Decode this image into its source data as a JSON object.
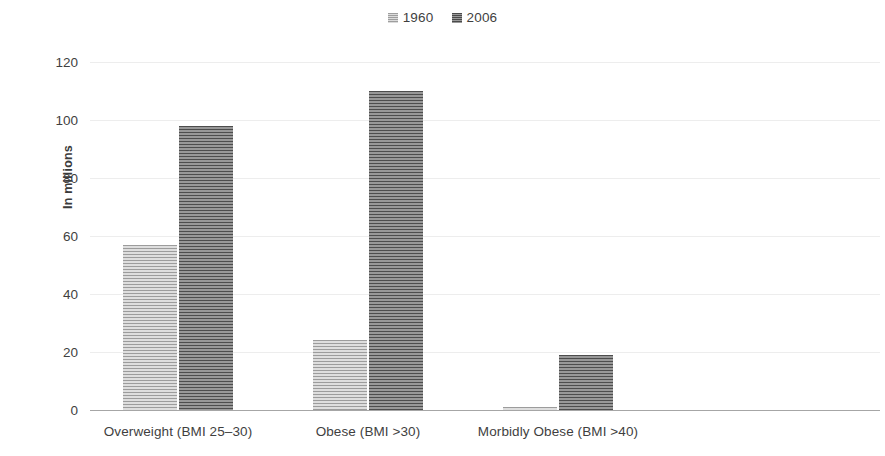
{
  "chart_data": {
    "type": "bar",
    "title": "",
    "xlabel": "",
    "ylabel": "In millions",
    "ylim": [
      0,
      120
    ],
    "yticks": [
      0,
      20,
      40,
      60,
      80,
      100,
      120
    ],
    "grid": true,
    "legend_position": "top-center",
    "categories": [
      "Overweight (BMI 25–30)",
      "Obese (BMI >30)",
      "Morbidly Obese (BMI >40)"
    ],
    "series": [
      {
        "name": "1960",
        "color": "#c4c4c4",
        "values": [
          57,
          24,
          1
        ]
      },
      {
        "name": "2006",
        "color": "#7a7a7a",
        "values": [
          98,
          110,
          19
        ]
      }
    ]
  },
  "legend": {
    "items": [
      {
        "label": "1960",
        "swatch": "legend-swatch-1960"
      },
      {
        "label": "2006",
        "swatch": "legend-swatch-2006"
      }
    ]
  },
  "axis": {
    "y_title": "In millions",
    "y_tick_labels": [
      "120",
      "100",
      "80",
      "60",
      "40",
      "20",
      "0"
    ]
  },
  "colors": {
    "series_1960": "#c4c4c4",
    "series_2006": "#7a7a7a",
    "gridline": "#ededed",
    "axis": "#a6a6a6",
    "text": "#3f3f3f"
  }
}
